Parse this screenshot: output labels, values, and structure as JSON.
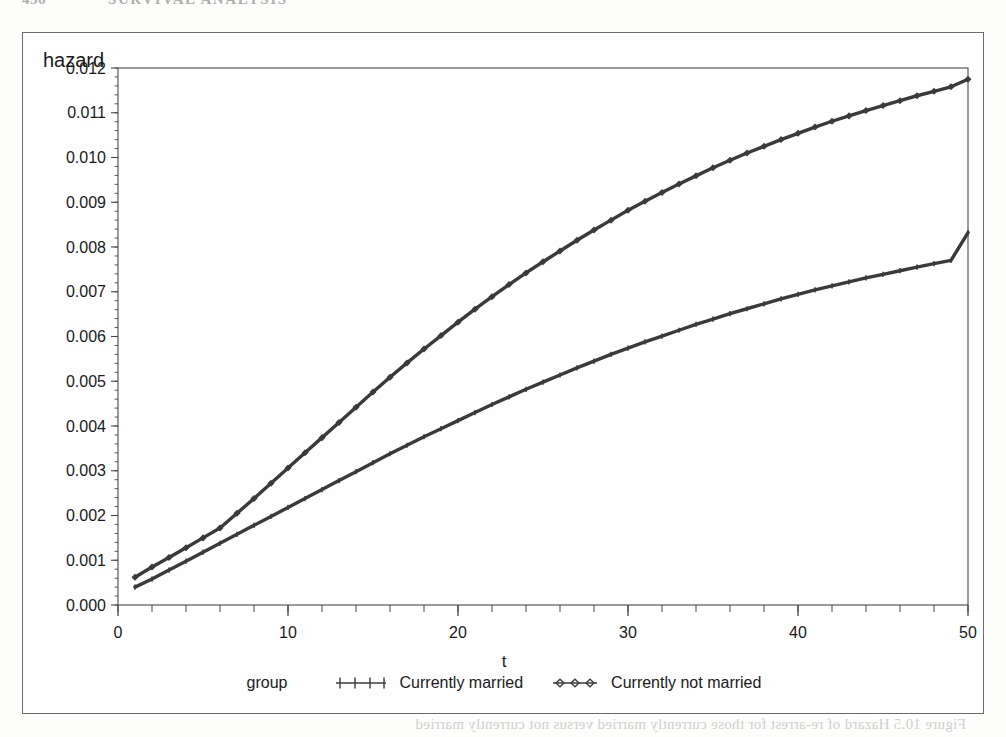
{
  "running_head": {
    "page_number": "436",
    "title": "SURVIVAL ANALYSIS"
  },
  "figure": {
    "y_axis_title": "hazard",
    "x_axis_title": "t"
  },
  "legend": {
    "title": "group",
    "entries": [
      {
        "label": "Currently married",
        "marker": "plus-marker",
        "color": "#3a3a3a"
      },
      {
        "label": "Currently not married",
        "marker": "diamond-marker",
        "color": "#3a3a3a"
      }
    ]
  },
  "bleed_note": {
    "text": "Figure 10.5  Hazard of re-arrest for those currently married versus not currently married"
  },
  "chart_data": {
    "type": "line",
    "title": "",
    "xlabel": "t",
    "ylabel": "hazard",
    "xlim": [
      0,
      50
    ],
    "ylim": [
      0.0,
      0.012
    ],
    "xticks": [
      0,
      10,
      20,
      30,
      40,
      50
    ],
    "yticks": [
      0.0,
      0.001,
      0.002,
      0.003,
      0.004,
      0.005,
      0.006,
      0.007,
      0.008,
      0.009,
      0.01,
      0.011,
      0.012
    ],
    "ytick_labels": [
      "0.000",
      "0.001",
      "0.002",
      "0.003",
      "0.004",
      "0.005",
      "0.006",
      "0.007",
      "0.008",
      "0.009",
      "0.010",
      "0.011",
      "0.012"
    ],
    "xtick_labels": [
      "0",
      "10",
      "20",
      "30",
      "40",
      "50"
    ],
    "x_minor_tick_interval": 2,
    "y_minor_tick_interval": 0.0002,
    "grid": false,
    "legend_position": "bottom-center",
    "x": [
      1,
      2,
      3,
      4,
      5,
      6,
      7,
      8,
      9,
      10,
      11,
      12,
      13,
      14,
      15,
      16,
      17,
      18,
      19,
      20,
      21,
      22,
      23,
      24,
      25,
      26,
      27,
      28,
      29,
      30,
      31,
      32,
      33,
      34,
      35,
      36,
      37,
      38,
      39,
      40,
      41,
      42,
      43,
      44,
      45,
      46,
      47,
      48,
      49,
      50
    ],
    "series": [
      {
        "name": "Currently not married",
        "marker": "diamond-marker",
        "color": "#3a3a3a",
        "values": [
          0.00062,
          0.00085,
          0.00106,
          0.00128,
          0.0015,
          0.00172,
          0.00205,
          0.00238,
          0.00272,
          0.00306,
          0.0034,
          0.00374,
          0.00408,
          0.00442,
          0.00476,
          0.00509,
          0.00541,
          0.00572,
          0.00602,
          0.00632,
          0.00661,
          0.00689,
          0.00716,
          0.00742,
          0.00767,
          0.00791,
          0.00815,
          0.00838,
          0.0086,
          0.00882,
          0.00902,
          0.00922,
          0.00941,
          0.00959,
          0.00977,
          0.00994,
          0.0101,
          0.01025,
          0.0104,
          0.01054,
          0.01068,
          0.01081,
          0.01093,
          0.01105,
          0.01116,
          0.01127,
          0.01138,
          0.01148,
          0.01158,
          0.01175
        ]
      },
      {
        "name": "Currently married",
        "marker": "plus-marker",
        "color": "#3a3a3a",
        "values": [
          0.0004,
          0.00058,
          0.00078,
          0.00098,
          0.00118,
          0.00138,
          0.00158,
          0.00178,
          0.00198,
          0.00218,
          0.00238,
          0.00258,
          0.00278,
          0.00298,
          0.00318,
          0.00338,
          0.00357,
          0.00376,
          0.00394,
          0.00412,
          0.0043,
          0.00448,
          0.00465,
          0.00482,
          0.00498,
          0.00514,
          0.0053,
          0.00545,
          0.0056,
          0.00574,
          0.00588,
          0.00601,
          0.00614,
          0.00627,
          0.00639,
          0.00651,
          0.00662,
          0.00673,
          0.00684,
          0.00694,
          0.00704,
          0.00713,
          0.00722,
          0.00731,
          0.00739,
          0.00747,
          0.00755,
          0.00763,
          0.0077,
          0.00832
        ]
      }
    ]
  }
}
